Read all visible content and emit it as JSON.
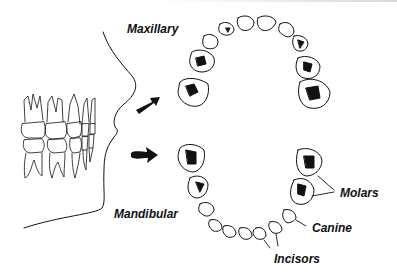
{
  "figure": {
    "labels": {
      "maxillary": "Maxillary",
      "mandibular": "Mandibular",
      "molars": "Molars",
      "canine": "Canine",
      "incisors": "Incisors"
    },
    "colors": {
      "ink": "#111111",
      "background": "#ffffff"
    },
    "icons": [
      "arrow-right-up-icon",
      "arrow-right-icon"
    ]
  }
}
